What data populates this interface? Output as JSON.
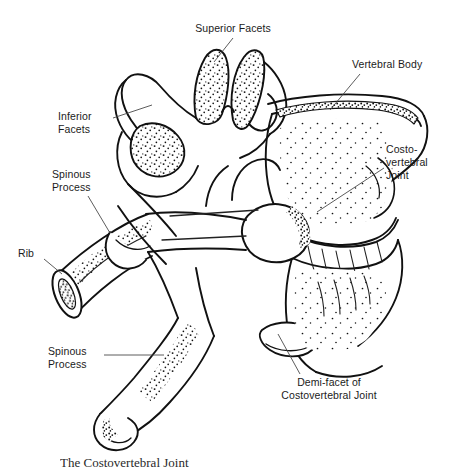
{
  "figure": {
    "title": "The Costovertebral Joint",
    "caption": "The Costovertebral Joint",
    "background_color": "#ffffff",
    "ink_color": "#111111",
    "leader_line_color": "#4a4a4a",
    "style": "pen-and-ink stipple line drawing"
  },
  "labels": [
    {
      "id": "superior-facets",
      "text": "Superior Facets",
      "align": "center",
      "leader": {
        "from_x": 233,
        "from_y": 38,
        "to_x": 214,
        "to_y": 62
      }
    },
    {
      "id": "vertebral-body",
      "text": "Vertebral Body",
      "align": "left",
      "leader": {
        "from_x": 360,
        "from_y": 74,
        "to_x": 330,
        "to_y": 110
      }
    },
    {
      "id": "inferior-facets",
      "text": "Inferior\nFacets",
      "align": "left",
      "leader": {
        "from_x": 113,
        "from_y": 118,
        "to_x": 152,
        "to_y": 105
      }
    },
    {
      "id": "costovertebral-joint",
      "text": "Costo-\nvertebral\nJoint",
      "align": "left",
      "leader": {
        "from_x": 384,
        "from_y": 168,
        "to_x": 317,
        "to_y": 212
      }
    },
    {
      "id": "spinous-process-upper",
      "text": "Spinous\nProcess",
      "align": "left",
      "leader": {
        "from_x": 88,
        "from_y": 196,
        "to_x": 110,
        "to_y": 233
      }
    },
    {
      "id": "rib",
      "text": "Rib",
      "align": "left",
      "leader": {
        "from_x": 44,
        "from_y": 259,
        "to_x": 62,
        "to_y": 274
      }
    },
    {
      "id": "spinous-process-lower",
      "text": "Spinous\nProcess",
      "align": "left",
      "leader": {
        "from_x": 104,
        "from_y": 355,
        "to_x": 164,
        "to_y": 355
      }
    },
    {
      "id": "demi-facet-costovertebral",
      "text": "Demi-facet of\nCostovertebral Joint",
      "align": "center",
      "leader": {
        "from_x": 300,
        "from_y": 374,
        "to_x": 278,
        "to_y": 334
      }
    }
  ]
}
